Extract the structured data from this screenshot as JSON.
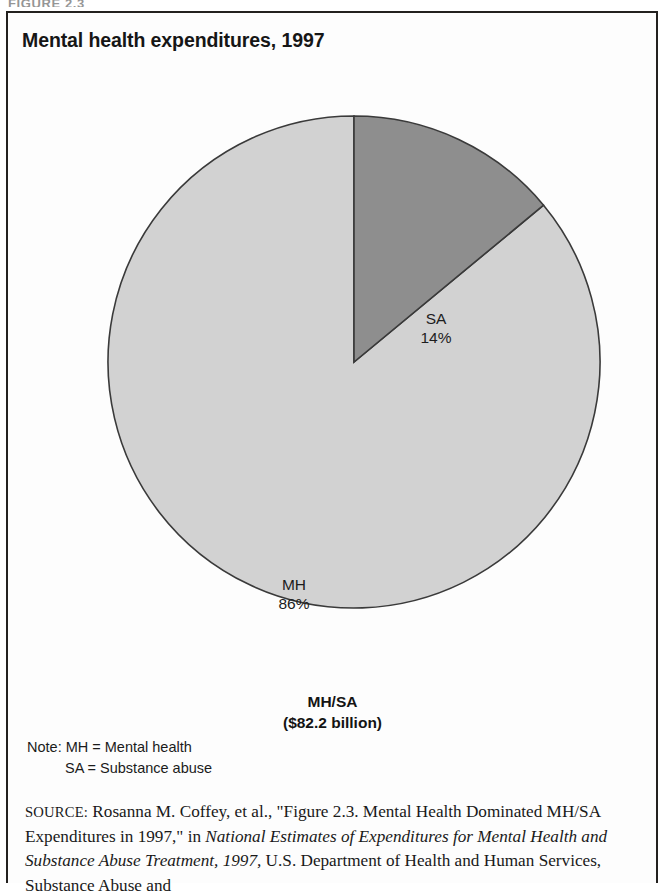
{
  "figure": {
    "label": "FIGURE 2.3",
    "title": "Mental health expenditures, 1997"
  },
  "caption": {
    "line1": "MH/SA",
    "line2": "($82.2 billion)"
  },
  "note": {
    "line1": "Note: MH = Mental health",
    "line2": "SA = Substance abuse"
  },
  "source": {
    "label": "SOURCE:",
    "part1": " Rosanna M. Coffey, et al., \"Figure 2.3. Mental Health Dominated MH/SA Expenditures in 1997,\" in ",
    "italic1": "National Estimates of Expenditures for Mental Health and Substance Abuse Treatment, 1997,",
    "part2": " U.S. Department of Health and Human Services, Substance Abuse and"
  },
  "colors": {
    "slice_mh": "#d2d2d2",
    "slice_sa": "#8e8e8e",
    "outline": "#3a3a3a",
    "frame": "#23211f",
    "text": "#1b1b1b"
  },
  "chart_data": {
    "type": "pie",
    "title": "Mental health expenditures, 1997",
    "subtitle": "MH/SA ($82.2 billion)",
    "total_label": "($82.2 billion)",
    "total_value": 82.2,
    "total_units": "billion USD",
    "categories": [
      "SA",
      "MH"
    ],
    "values": [
      14,
      86
    ],
    "value_units": "percent",
    "slices": [
      {
        "label": "SA",
        "name": "Substance abuse",
        "value": 14,
        "value_label": "14%",
        "color": "#8e8e8e",
        "start_angle_deg": 0,
        "end_angle_deg": 50.4
      },
      {
        "label": "MH",
        "name": "Mental health",
        "value": 86,
        "value_label": "86%",
        "color": "#d2d2d2",
        "start_angle_deg": 50.4,
        "end_angle_deg": 360
      }
    ],
    "legend": "none",
    "start_at_twelve_oclock": true,
    "direction": "clockwise",
    "grid": false
  }
}
